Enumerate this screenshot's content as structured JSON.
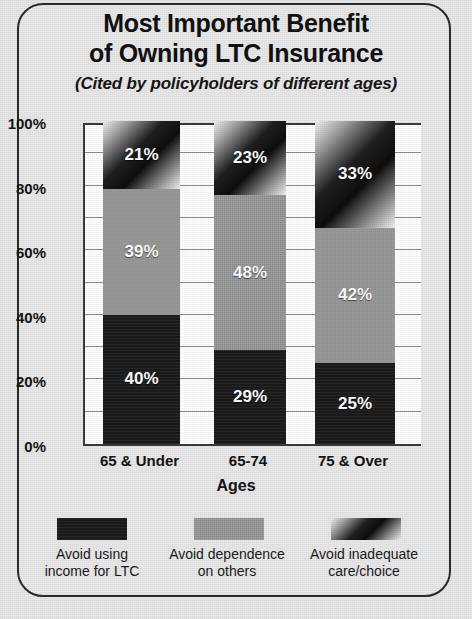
{
  "title": {
    "line1": "Most Important Benefit",
    "line2": "of Owning LTC Insurance",
    "subtitle": "(Cited by policyholders of different ages)"
  },
  "chart_data": {
    "type": "bar",
    "stacked": true,
    "title": "Most Important Benefit of Owning LTC Insurance",
    "subtitle": "(Cited by policyholders of different ages)",
    "xlabel": "Ages",
    "ylabel": "",
    "ylim": [
      0,
      100
    ],
    "unit": "%",
    "grid": true,
    "gridline_interval": 10,
    "legend_position": "bottom",
    "categories": [
      "65 & Under",
      "65-74",
      "75 & Over"
    ],
    "ytick_labels": [
      "0%",
      "20%",
      "40%",
      "60%",
      "80%",
      "100%"
    ],
    "ytick_values": [
      0,
      20,
      40,
      60,
      80,
      100
    ],
    "series": [
      {
        "name": "Avoid using income for LTC",
        "legend_line1": "Avoid using",
        "legend_line2": "income for LTC",
        "fill": "dark",
        "color": "#1b1b1b",
        "values": [
          40,
          29,
          25
        ],
        "labels": [
          "40%",
          "29%",
          "25%"
        ]
      },
      {
        "name": "Avoid dependence on others",
        "legend_line1": "Avoid dependence",
        "legend_line2": "on others",
        "fill": "gray",
        "color": "#989898",
        "values": [
          39,
          48,
          42
        ],
        "labels": [
          "39%",
          "48%",
          "42%"
        ]
      },
      {
        "name": "Avoid inadequate care/choice",
        "legend_line1": "Avoid inadequate",
        "legend_line2": "care/choice",
        "fill": "gradient",
        "color": "#202020",
        "values": [
          21,
          23,
          33
        ],
        "labels": [
          "21%",
          "23%",
          "33%"
        ]
      }
    ]
  },
  "axis": {
    "x_title": "Ages",
    "yticks": [
      "100%",
      "80%",
      "60%",
      "40%",
      "20%",
      "0%"
    ]
  }
}
